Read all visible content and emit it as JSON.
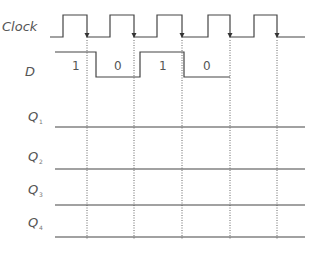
{
  "diagram": {
    "type": "timing-diagram",
    "colors": {
      "signal": "#444444",
      "label": "#555555",
      "dotted": "#666666",
      "background": "#ffffff"
    },
    "signals": [
      {
        "name": "Clock",
        "label": "Clock",
        "sub": ""
      },
      {
        "name": "D",
        "label": "D",
        "sub": ""
      },
      {
        "name": "Q1",
        "label": "Q",
        "sub": "1"
      },
      {
        "name": "Q2",
        "label": "Q",
        "sub": "2"
      },
      {
        "name": "Q3",
        "label": "Q",
        "sub": "3"
      },
      {
        "name": "Q4",
        "label": "Q",
        "sub": "4"
      }
    ],
    "clock": {
      "pulses": 5,
      "pulse_count_label": "5 clock pulses, falling-edge triggered (arrows on falling edges)"
    },
    "d_values": [
      "1",
      "0",
      "1",
      "0"
    ]
  }
}
